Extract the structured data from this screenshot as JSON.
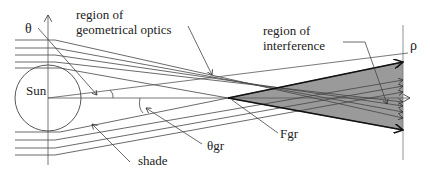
{
  "labels": {
    "theta": "θ",
    "geo_line1": "region of",
    "geo_line2": "geometrical optics",
    "interf_line1": "region of",
    "interf_line2": "interference",
    "rho": "ρ",
    "sun": "Sun",
    "fgr": "Fgr",
    "theta_gr": "θgr",
    "shade": "shade"
  },
  "colors": {
    "line": "#333333",
    "thin_line": "#555555",
    "shaded_region": "#9a9a9a",
    "background": "#ffffff"
  }
}
